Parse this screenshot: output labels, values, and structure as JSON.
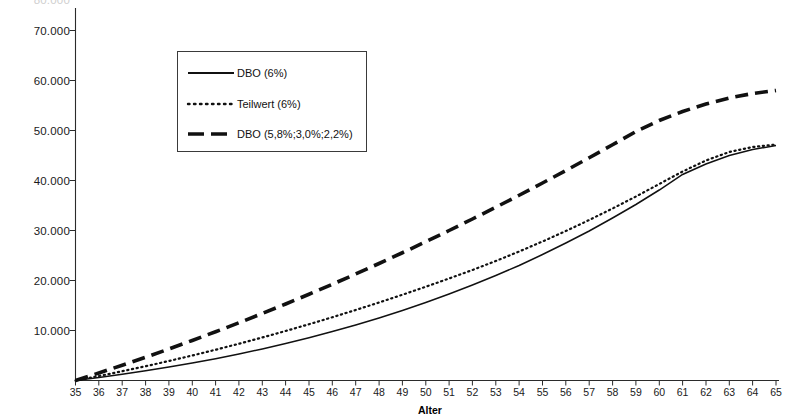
{
  "chart_data": {
    "type": "line",
    "title": "",
    "xlabel": "Alter",
    "ylabel": "",
    "xlim": [
      35,
      65
    ],
    "ylim": [
      0,
      70000
    ],
    "grid": false,
    "legend_position": "upper-left-inside",
    "x": [
      35,
      36,
      37,
      38,
      39,
      40,
      41,
      42,
      43,
      44,
      45,
      46,
      47,
      48,
      49,
      50,
      51,
      52,
      53,
      54,
      55,
      56,
      57,
      58,
      59,
      60,
      61,
      62,
      63,
      64,
      65
    ],
    "xtick_labels": [
      "35",
      "36",
      "37",
      "38",
      "39",
      "40",
      "41",
      "42",
      "43",
      "44",
      "45",
      "46",
      "47",
      "48",
      "49",
      "50",
      "51",
      "52",
      "53",
      "54",
      "55",
      "56",
      "57",
      "58",
      "59",
      "60",
      "61",
      "62",
      "63",
      "64",
      "65"
    ],
    "ytick_labels": [
      "10.000",
      "20.000",
      "30.000",
      "40.000",
      "50.000",
      "60.000",
      "70.000"
    ],
    "ytick_values": [
      10000,
      20000,
      30000,
      40000,
      50000,
      60000,
      70000
    ],
    "ghost_top_label": "80.000",
    "series": [
      {
        "name": "DBO (6%)",
        "style": "solid",
        "values": [
          0,
          600,
          1250,
          1950,
          2700,
          3500,
          4350,
          5300,
          6300,
          7400,
          8550,
          9800,
          11100,
          12500,
          14000,
          15600,
          17300,
          19100,
          21000,
          23000,
          25200,
          27500,
          29900,
          32500,
          35200,
          38100,
          41200,
          43300,
          45000,
          46200,
          47000
        ]
      },
      {
        "name": "Teilwert (6%)",
        "style": "dotted",
        "values": [
          0,
          900,
          1850,
          2850,
          3900,
          5000,
          6150,
          7350,
          8600,
          9900,
          11250,
          12650,
          14100,
          15600,
          17150,
          18750,
          20400,
          22100,
          23900,
          25800,
          27800,
          29900,
          32100,
          34400,
          36800,
          39300,
          41800,
          44000,
          45700,
          46700,
          47200
        ]
      },
      {
        "name": "DBO (5,8%;3,0%;2,2%)",
        "style": "dashed",
        "values": [
          0,
          1500,
          3050,
          4650,
          6300,
          8000,
          9750,
          11550,
          13400,
          15300,
          17250,
          19250,
          21300,
          23400,
          25550,
          27750,
          30000,
          32300,
          34650,
          37050,
          39500,
          42000,
          44550,
          47150,
          49800,
          52000,
          53800,
          55300,
          56500,
          57400,
          58000
        ]
      }
    ]
  },
  "legend": {
    "items": [
      {
        "label": "DBO (6%)"
      },
      {
        "label": "Teilwert (6%)"
      },
      {
        "label": "DBO (5,8%;3,0%;2,2%)"
      }
    ]
  }
}
